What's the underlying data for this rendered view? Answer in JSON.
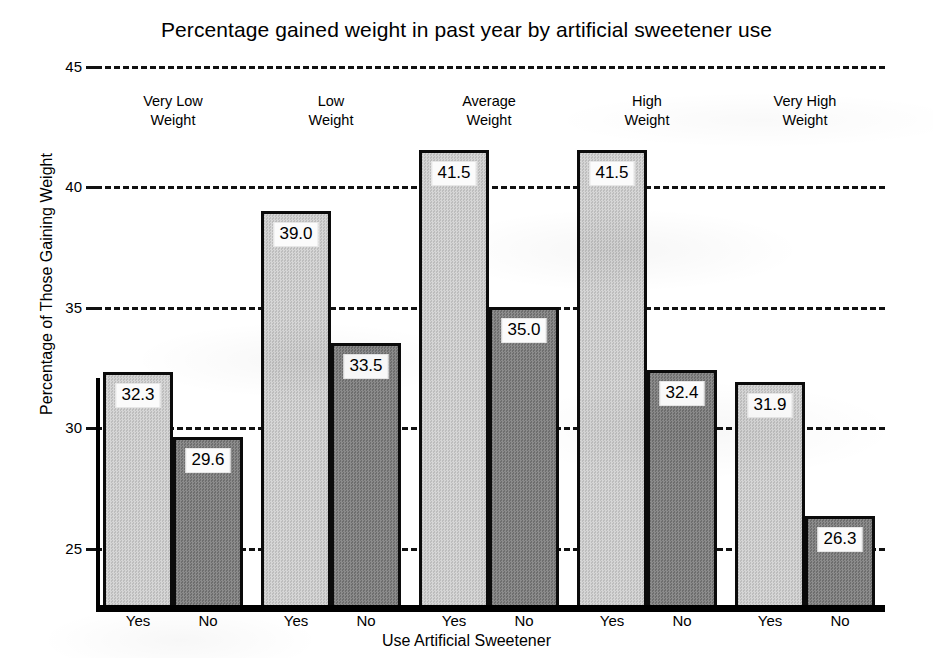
{
  "chart_data": {
    "type": "bar",
    "title": "Percentage gained weight in past year by artificial sweetener use",
    "xlabel": "Use Artificial Sweetener",
    "ylabel": "Percentage of Those Gaining Weight",
    "ylim": [
      22.5,
      45
    ],
    "yticks": [
      "45",
      "40",
      "35",
      "30",
      "25"
    ],
    "ytick_values": [
      45,
      40,
      35,
      30,
      25
    ],
    "grid": "horizontal-dashed",
    "legend": "none",
    "categories": [
      "Very Low Weight",
      "Low Weight",
      "Average Weight",
      "High Weight",
      "Very High Weight"
    ],
    "category_lines": [
      [
        "Very Low",
        "Weight"
      ],
      [
        "Low",
        "Weight"
      ],
      [
        "Average",
        "Weight"
      ],
      [
        "High",
        "Weight"
      ],
      [
        "Very High",
        "Weight"
      ]
    ],
    "subcategories": [
      "Yes",
      "No"
    ],
    "series": [
      {
        "name": "Yes",
        "values": [
          32.3,
          39.0,
          41.5,
          41.5,
          31.9
        ]
      },
      {
        "name": "No",
        "values": [
          29.6,
          33.5,
          35.0,
          32.4,
          26.3
        ]
      }
    ],
    "data_labels": [
      "32.3",
      "29.6",
      "39.0",
      "33.5",
      "41.5",
      "35.0",
      "41.5",
      "32.4",
      "31.9",
      "26.3"
    ],
    "colors": {
      "yes_bar": "#c9c9c9",
      "no_bar": "#7d7d7d",
      "bar_outline": "#0b0b0b",
      "axis": "#000000",
      "grid": "#111111",
      "background": "#ffffff"
    }
  },
  "bars": [
    {
      "group": 0,
      "series": "Yes",
      "label": "32.3",
      "value": 32.3
    },
    {
      "group": 0,
      "series": "No",
      "label": "29.6",
      "value": 29.6
    },
    {
      "group": 1,
      "series": "Yes",
      "label": "39.0",
      "value": 39.0
    },
    {
      "group": 1,
      "series": "No",
      "label": "33.5",
      "value": 33.5
    },
    {
      "group": 2,
      "series": "Yes",
      "label": "41.5",
      "value": 41.5
    },
    {
      "group": 2,
      "series": "No",
      "label": "35.0",
      "value": 35.0
    },
    {
      "group": 3,
      "series": "Yes",
      "label": "41.5",
      "value": 41.5
    },
    {
      "group": 3,
      "series": "No",
      "label": "32.4",
      "value": 32.4
    },
    {
      "group": 4,
      "series": "Yes",
      "label": "31.9",
      "value": 31.9
    },
    {
      "group": 4,
      "series": "No",
      "label": "26.3",
      "value": 26.3
    }
  ],
  "xticks": [
    "Yes",
    "No",
    "Yes",
    "No",
    "Yes",
    "No",
    "Yes",
    "No",
    "Yes",
    "No"
  ]
}
